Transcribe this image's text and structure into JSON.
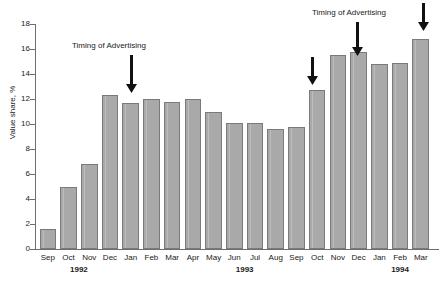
{
  "chart_data": {
    "type": "bar",
    "title": "",
    "xlabel": "",
    "ylabel": "Value share, %",
    "ylim": [
      0,
      18
    ],
    "yticks": [
      0,
      2,
      4,
      6,
      8,
      10,
      12,
      14,
      16,
      18
    ],
    "grid": false,
    "legend": null,
    "bar_color": "#a9a9a9",
    "bar_edge_color": "#7a7a7a",
    "categories": [
      "Sep",
      "Oct",
      "Nov",
      "Dec",
      "Jan",
      "Feb",
      "Mar",
      "Apr",
      "May",
      "Jun",
      "Jul",
      "Aug",
      "Sep",
      "Oct",
      "Nov",
      "Dec",
      "Jan",
      "Feb",
      "Mar"
    ],
    "values": [
      1.6,
      5.0,
      6.8,
      12.3,
      11.7,
      12.0,
      11.8,
      12.0,
      11.0,
      10.1,
      10.1,
      9.6,
      9.8,
      12.7,
      15.5,
      15.8,
      14.8,
      14.9,
      16.8
    ],
    "year_groups": [
      {
        "label": "1992",
        "start_index": 0,
        "end_index": 3
      },
      {
        "label": "1993",
        "start_index": 4,
        "end_index": 15
      },
      {
        "label": "1994",
        "start_index": 16,
        "end_index": 18
      }
    ],
    "annotations": [
      {
        "text": "Timing of Advertising",
        "label_x": 72,
        "label_y": 41,
        "arrows": [
          {
            "target_index": 3,
            "arrow_x": 131,
            "arrow_top": 55,
            "arrow_height": 38
          }
        ]
      },
      {
        "text": "Timing of Advertising",
        "label_x": 312,
        "label_y": 8,
        "arrows": [
          {
            "target_index": 13,
            "arrow_x": 312,
            "arrow_top": 57,
            "arrow_height": 28
          },
          {
            "target_index": 15,
            "arrow_x": 357,
            "arrow_top": 22,
            "arrow_height": 34
          },
          {
            "target_index": 18,
            "arrow_x": 423,
            "arrow_top": 3,
            "arrow_height": 28
          }
        ]
      }
    ]
  }
}
